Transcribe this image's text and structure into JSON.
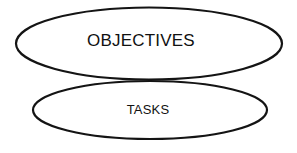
{
  "diagram": {
    "type": "venn-overlapping-ellipses",
    "background_color": "#ffffff",
    "stroke_color": "#141414",
    "shapes": [
      {
        "id": "objectives",
        "shape": "ellipse",
        "label": "OBJECTIVES",
        "cx": 149,
        "cy": 43.5,
        "rx": 133,
        "ry": 36,
        "stroke_width": 2.2,
        "fill": "none",
        "label_x": 141,
        "label_y": 42,
        "font_size": 17
      },
      {
        "id": "tasks",
        "shape": "ellipse",
        "label": "TASKS",
        "cx": 150,
        "cy": 110,
        "rx": 117,
        "ry": 29,
        "stroke_width": 2.2,
        "fill": "none",
        "label_x": 148,
        "label_y": 111,
        "font_size": 13
      }
    ]
  }
}
